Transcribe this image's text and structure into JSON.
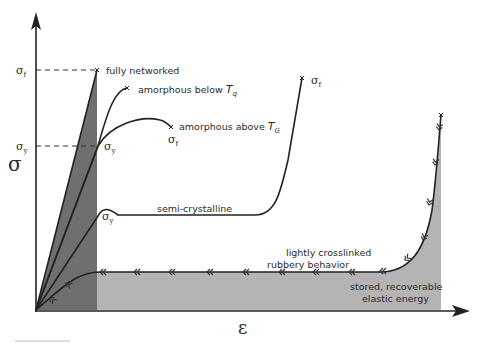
{
  "axes": {
    "y_label": "σ",
    "x_label": "ε"
  },
  "curves": [
    {
      "id": "fully-networked",
      "label": "fully networked"
    },
    {
      "id": "amorphous-below",
      "label": "amorphous below ",
      "sub_symbol": "T",
      "sub": "q"
    },
    {
      "id": "amorphous-above",
      "label": "amorphous above ",
      "sub_symbol": "T",
      "sub": "G"
    },
    {
      "id": "semi-crystalline",
      "label": "semi-crystalline"
    },
    {
      "id": "lightly-crosslinked",
      "label_line1": "lightly crosslinked",
      "label_line2": "rubbery behavior"
    }
  ],
  "annotations": {
    "sigma_f_axis": "σ",
    "sigma_f_sub": "f",
    "sigma_y": "σ",
    "sigma_y_sub": "y",
    "stored_energy_line1": "stored, recoverable",
    "stored_energy_line2": "elastic energy"
  },
  "colors": {
    "dark_fill": "#6f6f6f",
    "light_fill": "#b4b4b4",
    "line": "#222222"
  }
}
